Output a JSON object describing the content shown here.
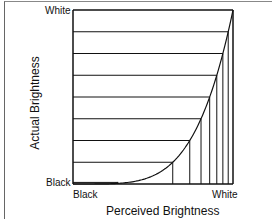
{
  "chart_data": {
    "type": "line",
    "title": "",
    "xlabel": "Perceived Brightness",
    "ylabel": "Actual Brightness",
    "x_tick_labels": [
      "Black",
      "White"
    ],
    "y_tick_labels": [
      "Black",
      "White"
    ],
    "xlim": [
      0,
      1
    ],
    "ylim": [
      0,
      1
    ],
    "grid": false,
    "legend": null,
    "gamma": 4.4,
    "actual_levels": [
      0.0,
      0.125,
      0.25,
      0.375,
      0.5,
      0.625,
      0.75,
      0.875,
      1.0
    ],
    "perceived_levels": [
      0.0,
      0.625,
      0.731,
      0.801,
      0.855,
      0.899,
      0.937,
      0.97,
      1.0
    ],
    "near_black_step": {
      "actual": 0.012,
      "perceived": 0.28
    },
    "series": [
      {
        "name": "response curve",
        "x": [
          0,
          0.28,
          0.625,
          0.731,
          0.801,
          0.855,
          0.899,
          0.937,
          0.97,
          1.0
        ],
        "y": [
          0,
          0.012,
          0.125,
          0.25,
          0.375,
          0.5,
          0.625,
          0.75,
          0.875,
          1.0
        ]
      }
    ]
  },
  "labels": {
    "y_top": "White",
    "y_bottom": "Black",
    "x_left": "Black",
    "x_right": "White",
    "x_title": "Perceived Brightness",
    "y_title": "Actual Brightness"
  },
  "colors": {
    "line": "#111111",
    "background": "#ffffff",
    "frame": "#777777"
  }
}
